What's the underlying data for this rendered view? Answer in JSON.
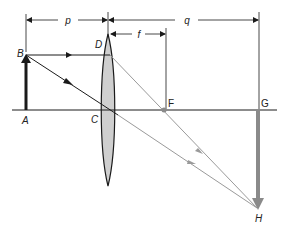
{
  "diagram": {
    "dimension_labels": {
      "object_distance": "p",
      "image_distance": "q",
      "focal_length": "f"
    },
    "point_labels": {
      "A": "A",
      "B": "B",
      "C": "C",
      "D": "D",
      "F": "F",
      "G": "G",
      "H": "H"
    },
    "colors": {
      "ink": "#1a1a1a",
      "lens_fill": "#cfcfcf",
      "image_arrow": "#8a8a8a",
      "refracted_ray": "#9a9a9a",
      "focal_point": "#8a8a8a"
    },
    "elements": [
      {
        "id": "optical-axis",
        "desc": "horizontal principal axis"
      },
      {
        "id": "object-arrow",
        "from": "A",
        "to": "B",
        "desc": "upright object"
      },
      {
        "id": "lens",
        "desc": "biconvex lens centered at C"
      },
      {
        "id": "image-arrow",
        "from": "G",
        "to": "H",
        "desc": "inverted real image"
      },
      {
        "id": "ray-parallel",
        "path": [
          "B",
          "D",
          "F",
          "H"
        ]
      },
      {
        "id": "ray-central",
        "path": [
          "B",
          "C",
          "H"
        ]
      }
    ]
  }
}
